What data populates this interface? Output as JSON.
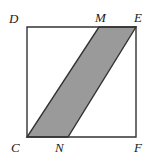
{
  "figure": {
    "kind": "geometry-diagram",
    "canvas": {
      "width": 151,
      "height": 163
    },
    "colors": {
      "background": "#ffffff",
      "stroke": "#333333",
      "shaded_fill": "#9a9a9a",
      "label_color": "#1a1a1a"
    },
    "square": {
      "name": "CDEF",
      "stroke_width": 1.4,
      "points": "27,27 136,27 136,137 27,137",
      "vertices": [
        {
          "id": "D",
          "x": 27,
          "y": 27
        },
        {
          "id": "E",
          "x": 136,
          "y": 27
        },
        {
          "id": "F",
          "x": 136,
          "y": 137
        },
        {
          "id": "C",
          "x": 27,
          "y": 137
        }
      ]
    },
    "shaded_region": {
      "name": "CNEM",
      "shape": "parallelogram",
      "stroke_width": 1.4,
      "points": "27,137 68,137 136,27 99,27",
      "vertices": [
        {
          "id": "C",
          "x": 27,
          "y": 137
        },
        {
          "id": "N",
          "x": 68,
          "y": 137
        },
        {
          "id": "E",
          "x": 136,
          "y": 27
        },
        {
          "id": "M",
          "x": 99,
          "y": 27
        }
      ]
    },
    "labels": {
      "D": "D",
      "M": "M",
      "E": "E",
      "C": "C",
      "N": "N",
      "F": "F"
    }
  }
}
